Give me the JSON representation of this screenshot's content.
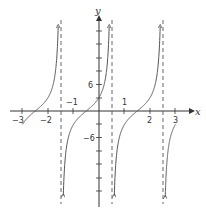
{
  "chart_data": {
    "type": "line",
    "title": "",
    "xlabel": "x",
    "ylabel": "y",
    "function": "y = 3·tan(π/2·(x + 0.5))",
    "xlim": [
      -3.4,
      3.8
    ],
    "ylim": [
      -21,
      24
    ],
    "x_ticks": [
      -3,
      -2,
      -1,
      1,
      2,
      3
    ],
    "x_tick_labels": [
      "−3",
      "−2",
      "−1",
      "1",
      "2",
      "3"
    ],
    "y_ticks": [
      -18,
      -15,
      -12,
      -9,
      -6,
      -3,
      3,
      6,
      9,
      12,
      15,
      18
    ],
    "y_tick_labels_shown": [
      "6",
      "−6"
    ],
    "asymptotes_x": [
      -1.5,
      0.5,
      2.5
    ],
    "zeros_x": [
      -2.5,
      -0.5,
      1.5
    ],
    "y_intercept": 3,
    "period": 2,
    "grid": false,
    "segments": [
      {
        "x_range": [
          -3,
          -1.5
        ],
        "note": "rises to +infinity at x=-1.5"
      },
      {
        "x_range": [
          -1.5,
          0.5
        ],
        "note": "from -infinity to +infinity"
      },
      {
        "x_range": [
          0.5,
          2.5
        ],
        "note": "from -infinity to +infinity"
      },
      {
        "x_range": [
          2.5,
          3
        ],
        "note": "from -infinity up to about -3 at x=3"
      }
    ]
  },
  "labels": {
    "x_axis": "x",
    "y_axis": "y",
    "xt_m3": "−3",
    "xt_m2": "−2",
    "xt_m1": "−1",
    "xt_1": "1",
    "xt_2": "2",
    "xt_3": "3",
    "yt_6": "6",
    "yt_m6": "−6"
  },
  "colors": {
    "curve": "#555555",
    "axis": "#333333",
    "asymptote": "#555555"
  }
}
